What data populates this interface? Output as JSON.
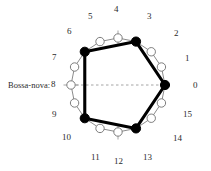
{
  "figure": {
    "label": "Bossa-nova:",
    "type": "rhythm-cycle-diagram",
    "pulses": 16,
    "onset_color": "#000000",
    "rest_color": "#ffffff",
    "rest_stroke": "#6f6f6f",
    "chord_color": "#000000",
    "axis_color": "#9a9a9a"
  },
  "geometry": {
    "cx": 118,
    "cy": 85,
    "radius": 47,
    "start_angle_deg": 0,
    "direction": "clockwise"
  },
  "chart_data": {
    "type": "scatter",
    "title": "Bossa-nova:",
    "xlabel": "",
    "ylabel": "",
    "categories": [
      "0",
      "1",
      "2",
      "3",
      "4",
      "5",
      "6",
      "7",
      "8",
      "9",
      "10",
      "11",
      "12",
      "13",
      "14",
      "15"
    ],
    "values": [
      1,
      0,
      0,
      1,
      0,
      0,
      1,
      0,
      0,
      0,
      1,
      0,
      0,
      1,
      0,
      0
    ],
    "onsets": [
      0,
      3,
      6,
      10,
      13
    ],
    "rests": [
      1,
      2,
      4,
      5,
      7,
      8,
      9,
      11,
      12,
      14,
      15
    ],
    "interonset_intervals": [
      3,
      3,
      4,
      3,
      3
    ],
    "axis_of_symmetry": {
      "from": 8,
      "to": 0,
      "style": "dashed"
    },
    "tick_marked_pulses": [
      4,
      8,
      12
    ],
    "legend": []
  },
  "labels": [
    {
      "id": "0",
      "text": "0",
      "x": 193,
      "y": 81
    },
    {
      "id": "1",
      "text": "1",
      "x": 185,
      "y": 54
    },
    {
      "id": "2",
      "text": "2",
      "x": 174,
      "y": 29
    },
    {
      "id": "3",
      "text": "3",
      "x": 147,
      "y": 12
    },
    {
      "id": "4",
      "text": "4",
      "x": 114,
      "y": 5
    },
    {
      "id": "5",
      "text": "5",
      "x": 88,
      "y": 12
    },
    {
      "id": "6",
      "text": "6",
      "x": 67,
      "y": 27
    },
    {
      "id": "7",
      "text": "7",
      "x": 52,
      "y": 53
    },
    {
      "id": "8",
      "text": "8",
      "x": 51,
      "y": 80
    },
    {
      "id": "9",
      "text": "9",
      "x": 52,
      "y": 110
    },
    {
      "id": "10",
      "text": "10",
      "x": 62,
      "y": 133
    },
    {
      "id": "11",
      "text": "11",
      "x": 91,
      "y": 153
    },
    {
      "id": "12",
      "text": "12",
      "x": 114,
      "y": 157
    },
    {
      "id": "13",
      "text": "13",
      "x": 143,
      "y": 153
    },
    {
      "id": "14",
      "text": "14",
      "x": 173,
      "y": 134
    },
    {
      "id": "15",
      "text": "15",
      "x": 183,
      "y": 110
    }
  ]
}
